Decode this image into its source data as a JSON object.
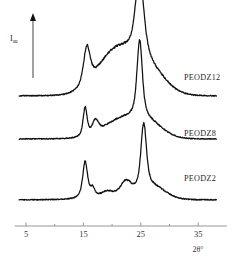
{
  "figure": {
    "type": "xrd-diffractogram",
    "background_color": "#ffffff",
    "curve_color": "#111111",
    "axis_color": "#8a8a8a"
  },
  "axes": {
    "x": {
      "title": "2θ°",
      "ticks_major": [
        5,
        15,
        25,
        35
      ],
      "tick_labels": [
        "5",
        "15",
        "25",
        "35"
      ],
      "ticks_minor": [
        10,
        20,
        30
      ],
      "range": [
        3,
        40
      ],
      "pixel_at_5": 26,
      "pixel_per_degree": 5.74,
      "baseline_y": 226
    },
    "y": {
      "label_main": "I",
      "label_sub": "au",
      "arrow": "up",
      "axis_x": 33,
      "axis_top": 14,
      "axis_bottom": 78
    }
  },
  "curves": [
    {
      "name": "PEODZ12",
      "label": "PEODZ12",
      "label_x": 184,
      "label_y": 73,
      "baseline_y": 96,
      "x_start": 3.8,
      "x_end": 38.2,
      "noise": 0.9,
      "features": [
        {
          "kind": "peak",
          "two_theta": 15.6,
          "height": 38,
          "width": 0.75,
          "shape": "sharp"
        },
        {
          "kind": "halo",
          "two_theta": 20.8,
          "height": 44,
          "width": 4.6,
          "shape": "broad"
        },
        {
          "kind": "peak",
          "two_theta": 24.8,
          "height": 82,
          "width": 0.95,
          "shape": "sharp"
        },
        {
          "kind": "tail",
          "two_theta": 26.5,
          "height": 22,
          "width": 4.0,
          "shape": "broad"
        }
      ]
    },
    {
      "name": "PEODZ8",
      "label": "PEODZ8",
      "label_x": 184,
      "label_y": 129,
      "baseline_y": 139,
      "x_start": 3.8,
      "x_end": 38.2,
      "noise": 0.8,
      "features": [
        {
          "kind": "peak",
          "two_theta": 15.3,
          "height": 29,
          "width": 0.45,
          "shape": "sharp"
        },
        {
          "kind": "shoulder",
          "two_theta": 17.1,
          "height": 13,
          "width": 0.7,
          "shape": "small"
        },
        {
          "kind": "halo",
          "two_theta": 21.5,
          "height": 18,
          "width": 4.2,
          "shape": "broad"
        },
        {
          "kind": "peak",
          "two_theta": 24.8,
          "height": 78,
          "width": 0.6,
          "shape": "sharp"
        },
        {
          "kind": "tail",
          "two_theta": 26.4,
          "height": 14,
          "width": 3.6,
          "shape": "broad"
        }
      ]
    },
    {
      "name": "PEODZ2",
      "label": "PEODZ2",
      "label_x": 184,
      "label_y": 174,
      "baseline_y": 200,
      "x_start": 3.8,
      "x_end": 38.2,
      "noise": 0.9,
      "features": [
        {
          "kind": "peak",
          "two_theta": 15.3,
          "height": 37,
          "width": 0.55,
          "shape": "sharp"
        },
        {
          "kind": "shoulder",
          "two_theta": 16.6,
          "height": 9,
          "width": 0.5,
          "shape": "small"
        },
        {
          "kind": "bump",
          "two_theta": 19.2,
          "height": 7,
          "width": 1.6,
          "shape": "small"
        },
        {
          "kind": "shoulder",
          "two_theta": 22.4,
          "height": 16,
          "width": 1.3,
          "shape": "small"
        },
        {
          "kind": "peak",
          "two_theta": 25.5,
          "height": 66,
          "width": 0.62,
          "shape": "sharp"
        },
        {
          "kind": "tail",
          "two_theta": 27.0,
          "height": 12,
          "width": 3.2,
          "shape": "broad"
        }
      ]
    }
  ],
  "chart_data": {
    "type": "line",
    "title": "",
    "xlabel": "2θ°",
    "ylabel": "I au",
    "xlim": [
      3,
      40
    ],
    "grid": false,
    "legend": "inline-right",
    "x_ticks": [
      5,
      15,
      25,
      35
    ],
    "x_ticks_minor": [
      10,
      20,
      30
    ],
    "series": [
      {
        "name": "PEODZ12",
        "offset_rank": 3,
        "peaks_two_theta": [
          15.6,
          24.8
        ],
        "peak_relative_heights": [
          38,
          82
        ],
        "amorphous_halo_center": 20.8,
        "description": "broad amorphous halo with crystalline peaks at 15.6 and 24.8 degrees"
      },
      {
        "name": "PEODZ8",
        "offset_rank": 2,
        "peaks_two_theta": [
          15.3,
          17.1,
          24.8
        ],
        "peak_relative_heights": [
          29,
          13,
          78
        ],
        "amorphous_halo_center": 21.5,
        "description": "sharp peaks at 15.3 and 24.8 degrees with shoulder at 17.1"
      },
      {
        "name": "PEODZ2",
        "offset_rank": 1,
        "peaks_two_theta": [
          15.3,
          16.6,
          19.2,
          22.4,
          25.5
        ],
        "peak_relative_heights": [
          37,
          9,
          7,
          16,
          66
        ],
        "amorphous_halo_center": null,
        "description": "sharp crystalline peaks at 15.3 and 25.5 degrees"
      }
    ]
  }
}
